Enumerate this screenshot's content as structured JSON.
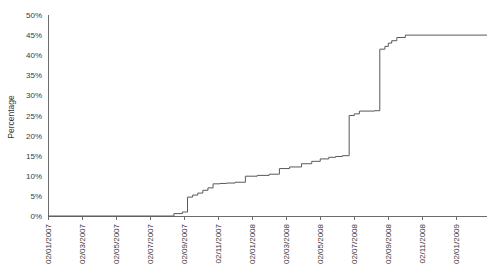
{
  "chart_data": {
    "type": "line",
    "title": "",
    "subtitle": "",
    "xlabel": "",
    "ylabel": "Percentage",
    "legend": [],
    "legend_position": "none",
    "grid": false,
    "line_color": "#595959",
    "background_color": "#ffffff",
    "axis_color": "#6b6b6b",
    "step_style": "post",
    "ylim": [
      0,
      50
    ],
    "y_tick_labels": [
      "0%",
      "5%",
      "10%",
      "15%",
      "20%",
      "25%",
      "30%",
      "35%",
      "40%",
      "45%",
      "50%"
    ],
    "y_tick_values": [
      0,
      5,
      10,
      15,
      20,
      25,
      30,
      35,
      40,
      45,
      50
    ],
    "x_tick_labels": [
      "02/01/2007",
      "02/03/2007",
      "02/05/2007",
      "02/07/2007",
      "02/09/2007",
      "02/11/2007",
      "02/01/2008",
      "02/03/2008",
      "02/05/2008",
      "02/07/2008",
      "02/09/2008",
      "02/11/2008",
      "02/01/2009"
    ],
    "x_tick_positions": [
      0,
      2,
      4,
      6,
      8,
      10,
      12,
      14,
      16,
      18,
      20,
      22,
      24
    ],
    "xlim": [
      0,
      25.8
    ],
    "x_unit": "months since 02/01/2007",
    "series": [
      {
        "name": "Cumulative percentage",
        "x": [
          0.0,
          7.0,
          7.4,
          7.9,
          8.2,
          8.5,
          8.8,
          9.1,
          9.4,
          9.7,
          10.1,
          10.5,
          11.0,
          11.6,
          12.3,
          13.0,
          13.6,
          14.2,
          14.9,
          15.5,
          16.0,
          16.5,
          16.9,
          17.3,
          17.7,
          18.0,
          18.3,
          19.2,
          19.5,
          19.8,
          20.0,
          20.2,
          20.5,
          21.0,
          25.8
        ],
        "values": [
          0.0,
          0.0,
          0.6,
          1.0,
          4.7,
          5.2,
          5.7,
          6.4,
          7.0,
          8.0,
          8.1,
          8.2,
          8.4,
          9.9,
          10.1,
          10.4,
          11.8,
          12.2,
          13.0,
          13.6,
          14.2,
          14.6,
          14.8,
          15.0,
          25.0,
          25.4,
          26.1,
          26.2,
          41.5,
          42.2,
          43.0,
          43.6,
          44.4,
          45.0,
          45.0
        ]
      }
    ],
    "annotations": [],
    "notable_features": [
      {
        "label": "flat at 0% until ~02/08/2007",
        "x": 7.0,
        "value": 0.0
      },
      {
        "label": "first major rise to ~5%",
        "x": 8.2,
        "value": 4.7
      },
      {
        "label": "gradual staircase 8% to 15%",
        "x": 16.9,
        "value": 14.8
      },
      {
        "label": "jump to ~25%",
        "x": 17.7,
        "value": 25.0
      },
      {
        "label": "plateau at ~26%",
        "x": 19.2,
        "value": 26.2
      },
      {
        "label": "sharp vertical jump to ~42%",
        "x": 19.5,
        "value": 41.5
      },
      {
        "label": "final plateau at 45%",
        "x": 21.0,
        "value": 45.0
      }
    ]
  }
}
